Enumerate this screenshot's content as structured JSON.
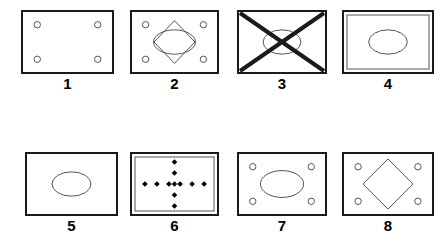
{
  "sheet": {
    "background": "#ffffff",
    "stroke": "#1a1a1a",
    "thin_stroke": "#555555",
    "width": 445,
    "height": 245,
    "rows": 2,
    "columns": 4
  },
  "panels": [
    {
      "label": "1",
      "name": "panel-1",
      "x": 21,
      "y": 10,
      "w": 93,
      "h": 64,
      "label_y": 76,
      "border": "thick",
      "contents": [
        "four-small-circles"
      ],
      "description": "Rectangle with four small open circles near the corners"
    },
    {
      "label": "2",
      "name": "panel-2",
      "x": 130,
      "y": 10,
      "w": 89,
      "h": 64,
      "label_y": 76,
      "border": "thick",
      "contents": [
        "four-small-circles",
        "diamond-outline",
        "ellipse-outline"
      ],
      "description": "Rectangle with four small circles, a diamond outline and an overlapping ellipse in the middle"
    },
    {
      "label": "3",
      "name": "panel-3",
      "x": 237,
      "y": 10,
      "w": 90,
      "h": 64,
      "label_y": 76,
      "border": "thick",
      "contents": [
        "ellipse-outline",
        "diagonal-cross"
      ],
      "description": "Rectangle with a thick X crossing corner to corner over a thin ellipse"
    },
    {
      "label": "4",
      "name": "panel-4",
      "x": 342,
      "y": 10,
      "w": 92,
      "h": 64,
      "label_y": 76,
      "border": "double",
      "contents": [
        "inner-rectangle",
        "ellipse-outline"
      ],
      "description": "Rectangle with an inner thin rectangle border and a centered ellipse"
    },
    {
      "label": "5",
      "name": "panel-5",
      "x": 25,
      "y": 152,
      "w": 93,
      "h": 64,
      "label_y": 218,
      "border": "thick",
      "contents": [
        "ellipse-outline"
      ],
      "description": "Rectangle with a single centered ellipse"
    },
    {
      "label": "6",
      "name": "panel-6",
      "x": 130,
      "y": 152,
      "w": 89,
      "h": 64,
      "label_y": 218,
      "border": "double",
      "contents": [
        "inner-rectangle",
        "diamond-cross-pattern"
      ],
      "description": "Rectangle with inner border and a plus/cross pattern made of small solid diamonds"
    },
    {
      "label": "7",
      "name": "panel-7",
      "x": 237,
      "y": 152,
      "w": 90,
      "h": 64,
      "label_y": 218,
      "border": "thick",
      "contents": [
        "four-small-circles",
        "ellipse-outline"
      ],
      "description": "Rectangle with four small circles around a centered ellipse"
    },
    {
      "label": "8",
      "name": "panel-8",
      "x": 342,
      "y": 152,
      "w": 92,
      "h": 64,
      "label_y": 218,
      "border": "thick",
      "contents": [
        "four-small-circles",
        "diamond-outline"
      ],
      "description": "Rectangle with four small circles around a centered diamond outline"
    }
  ]
}
